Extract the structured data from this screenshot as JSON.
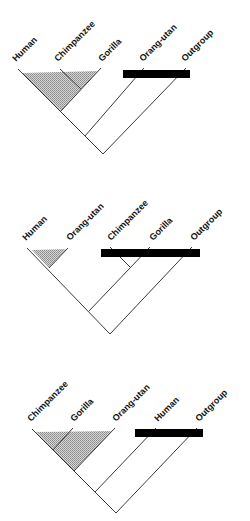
{
  "diagram": {
    "type": "cladogram-comparison",
    "bar_color": "#000000",
    "shade_color": "#b8b8b8",
    "trees": [
      {
        "id": "tree-1",
        "taxa": [
          "Human",
          "Chimpanzee",
          "Gorilla",
          "Orang-utan",
          "Outgroup"
        ],
        "shaded_clade": [
          "Human",
          "Chimpanzee",
          "Gorilla"
        ],
        "bar_across": [
          "Orang-utan",
          "Outgroup"
        ]
      },
      {
        "id": "tree-2",
        "taxa": [
          "Human",
          "Orang-utan",
          "Chimpanzee",
          "Gorilla",
          "Outgroup"
        ],
        "shaded_clade": [
          "Human",
          "Orang-utan"
        ],
        "bar_across": [
          "Chimpanzee",
          "Gorilla",
          "Outgroup"
        ]
      },
      {
        "id": "tree-3",
        "taxa": [
          "Chimpanzee",
          "Gorilla",
          "Orang-utan",
          "Human",
          "Outgroup"
        ],
        "shaded_clade": [
          "Chimpanzee",
          "Gorilla",
          "Orang-utan"
        ],
        "bar_across": [
          "Human",
          "Outgroup"
        ]
      }
    ]
  }
}
